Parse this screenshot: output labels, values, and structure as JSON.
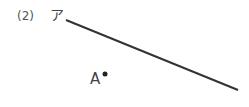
{
  "problem": {
    "number": "(2)",
    "line_label": "ア",
    "point_label": "A"
  },
  "figure": {
    "line": {
      "x1": 66,
      "y1": 20,
      "x2": 238,
      "y2": 90,
      "color": "#333333",
      "width": 2
    },
    "point": {
      "cx": 105,
      "cy": 74,
      "r": 2.5,
      "color": "#222222"
    }
  }
}
